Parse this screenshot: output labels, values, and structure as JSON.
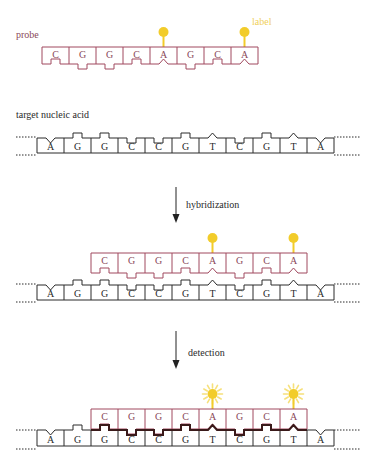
{
  "colors": {
    "probe": "#a0485e",
    "probe_text": "#8a4a5a",
    "target": "#2a2a2a",
    "hybrid_backbone": "#3a1a1a",
    "label": "#f2cc2a",
    "label_text": "#f0cf5a",
    "glow": "#f6e07a",
    "arrow": "#222222"
  },
  "labels": {
    "probe": "probe",
    "label": "label",
    "target": "target nucleic acid",
    "step1": "hybridization",
    "step2": "detection"
  },
  "probe_sequence": [
    "C",
    "G",
    "G",
    "C",
    "A",
    "G",
    "C",
    "A"
  ],
  "probe_label_positions": [
    4,
    7
  ],
  "target_sequence": [
    "A",
    "G",
    "G",
    "C",
    "C",
    "G",
    "T",
    "C",
    "G",
    "T",
    "A"
  ],
  "probe_offset_in_target": 2,
  "panels": [
    {
      "name": "probe-panel",
      "title_key": "probe"
    },
    {
      "name": "target-panel",
      "title_key": "target"
    },
    {
      "name": "hybridized-panel",
      "arrow_label_key": "step1"
    },
    {
      "name": "detection-panel",
      "arrow_label_key": "step2"
    }
  ]
}
